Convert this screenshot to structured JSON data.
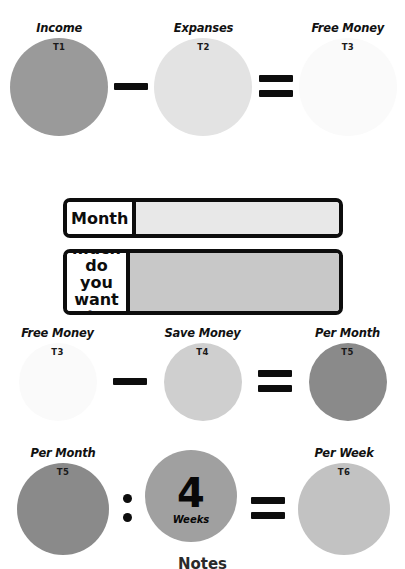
{
  "diagram": {
    "type": "budget-savings-worksheet",
    "background_color": "#ffffff",
    "operator_color": "#0d0d0d"
  },
  "rows": [
    {
      "id": "row-income-minus-expanses",
      "terms": [
        {
          "title": "Income",
          "code": "T1",
          "color": "#9a9a9a",
          "size": 98
        },
        {
          "title": "Expanses",
          "code": "T2",
          "color": "#e3e3e3",
          "size": 98
        },
        {
          "title": "Free Money",
          "code": "T3",
          "color": "#fafafa",
          "size": 98
        }
      ],
      "operators": [
        "minus",
        "equals"
      ]
    },
    {
      "id": "row-freemoney-minus-savemoney",
      "terms": [
        {
          "title": "Free Money",
          "code": "T3",
          "color": "#fafafa",
          "size": 78
        },
        {
          "title": "Save Money",
          "code": "T4",
          "color": "#cfcfcf",
          "size": 78
        },
        {
          "title": "Per Month",
          "code": "T5",
          "color": "#8a8a8a",
          "size": 78
        }
      ],
      "operators": [
        "minus",
        "equals"
      ]
    },
    {
      "id": "row-permonth-divided-weeks",
      "terms": [
        {
          "title": "Per Month",
          "code": "T5",
          "color": "#8a8a8a",
          "size": 92
        },
        {
          "title": "",
          "code": "",
          "color": "#a0a0a0",
          "size": 92
        },
        {
          "title": "Per Week",
          "code": "T6",
          "color": "#c2c2c2",
          "size": 92
        }
      ],
      "operators": [
        "divide",
        "equals"
      ]
    }
  ],
  "weeks_disc": {
    "number": "4",
    "label": "Weeks"
  },
  "fields": [
    {
      "id": "month-field",
      "label": "Month",
      "value": "",
      "placeholder": "",
      "input_color": "#e8e8e8"
    },
    {
      "id": "save-amount-field",
      "label": "How much do you want to save?",
      "value": "",
      "placeholder": "",
      "input_color": "#c8c8c8"
    }
  ],
  "footer": {
    "note": "Notes"
  }
}
